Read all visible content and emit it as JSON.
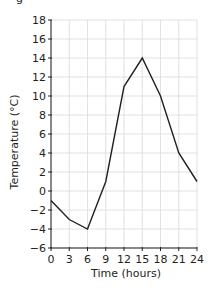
{
  "fragment_text": "g",
  "chart_data": {
    "type": "line",
    "title": "",
    "xlabel": "Time (hours)",
    "ylabel": "Temperature (°C)",
    "x": [
      0,
      3,
      6,
      9,
      12,
      15,
      18,
      21,
      24
    ],
    "series": [
      {
        "name": "Temperature",
        "values": [
          -1,
          -3,
          -4,
          1,
          11,
          14,
          10,
          4,
          1
        ]
      }
    ],
    "xlim": [
      0,
      24
    ],
    "ylim": [
      -6,
      18
    ],
    "xticks": [
      0,
      3,
      6,
      9,
      12,
      15,
      18,
      21,
      24
    ],
    "yticks": [
      -6,
      -4,
      -2,
      0,
      2,
      4,
      6,
      8,
      10,
      12,
      14,
      16,
      18
    ],
    "grid": true,
    "legend": null,
    "colors": {
      "line": "#231f20",
      "grid": "#d9d9d9",
      "axis": "#231f20"
    }
  }
}
